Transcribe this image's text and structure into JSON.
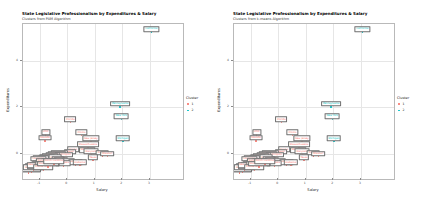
{
  "figure": {
    "background": "#ffffff",
    "panel_border": "#b9b9b9",
    "grid_color": "#f0f0f0"
  },
  "panels": [
    {
      "key": "pam",
      "title": "State Legislative Professionalism by Expenditures & Salary",
      "subtitle": "Clusters from PAM Algorithm",
      "legend_title": "Cluster"
    },
    {
      "key": "kmeans",
      "title": "State Legislative Professionalism by Expenditures & Salary",
      "subtitle": "Clusters from k-means Algorithm",
      "legend_title": "Cluster"
    }
  ],
  "chart_data": [
    {
      "type": "scatter",
      "title": "State Legislative Professionalism by Expenditures & Salary",
      "subtitle": "Clusters from PAM Algorithm",
      "xlabel": "Salary",
      "ylabel": "Expenditures",
      "xlim": [
        -1.6,
        4.2
      ],
      "ylim": [
        -1.1,
        5.6
      ],
      "xticks": [
        -1,
        0,
        1,
        2,
        3
      ],
      "yticks": [
        0,
        2,
        4
      ],
      "grid": true,
      "legend_position": "right",
      "legend_title": "Cluster",
      "legend_entries": [
        {
          "label": "1",
          "color": "#f8766d"
        },
        {
          "label": "2",
          "color": "#00bfc4"
        }
      ],
      "points": [
        {
          "label": "California",
          "x": 3.05,
          "y": 5.25,
          "cluster": "2"
        },
        {
          "label": "Pennsylvania",
          "x": 1.92,
          "y": 2.02,
          "cluster": "2"
        },
        {
          "label": "New York",
          "x": 1.96,
          "y": 1.48,
          "cluster": "2"
        },
        {
          "label": "Michigan",
          "x": 2.02,
          "y": 0.52,
          "cluster": "2"
        },
        {
          "label": "Florida",
          "x": 0.12,
          "y": 1.34,
          "cluster": "1"
        },
        {
          "label": "Illinois",
          "x": 0.52,
          "y": 0.78,
          "cluster": "1"
        },
        {
          "label": "Ohio",
          "x": -0.78,
          "y": 0.8,
          "cluster": "1"
        },
        {
          "label": "Nevada",
          "x": -0.8,
          "y": 0.55,
          "cluster": "1"
        },
        {
          "label": "New Jersey",
          "x": 0.86,
          "y": 0.52,
          "cluster": "1"
        },
        {
          "label": "Massachusetts",
          "x": 0.76,
          "y": 0.26,
          "cluster": "1"
        },
        {
          "label": "Wisconsin",
          "x": 0.72,
          "y": 0.02,
          "cluster": "1"
        },
        {
          "label": "Maryland",
          "x": 0.88,
          "y": -0.04,
          "cluster": "1"
        },
        {
          "label": "Alaska",
          "x": 0.22,
          "y": 0.04,
          "cluster": "1"
        },
        {
          "label": "Hawaii",
          "x": 0.1,
          "y": -0.06,
          "cluster": "1"
        },
        {
          "label": "Arizona",
          "x": 1.28,
          "y": -0.1,
          "cluster": "1"
        },
        {
          "label": "Missouri",
          "x": 1.46,
          "y": -0.14,
          "cluster": "1"
        },
        {
          "label": "Minnesota",
          "x": -0.28,
          "y": -0.1,
          "cluster": "1"
        },
        {
          "label": "Connecticut",
          "x": -0.38,
          "y": -0.14,
          "cluster": "1"
        },
        {
          "label": "Washington",
          "x": -0.12,
          "y": -0.18,
          "cluster": "1"
        },
        {
          "label": "Colorado",
          "x": -0.52,
          "y": -0.2,
          "cluster": "1"
        },
        {
          "label": "Oklahoma",
          "x": -0.62,
          "y": -0.24,
          "cluster": "1"
        },
        {
          "label": "Delaware",
          "x": -0.72,
          "y": -0.28,
          "cluster": "1"
        },
        {
          "label": "Virginia",
          "x": -0.44,
          "y": -0.3,
          "cluster": "1"
        },
        {
          "label": "Iowa",
          "x": -0.86,
          "y": -0.32,
          "cluster": "1"
        },
        {
          "label": "Tennessee",
          "x": -0.96,
          "y": -0.34,
          "cluster": "1"
        },
        {
          "label": "Louisiana",
          "x": -1.04,
          "y": -0.36,
          "cluster": "1"
        },
        {
          "label": "Oregon",
          "x": -0.34,
          "y": -0.38,
          "cluster": "1"
        },
        {
          "label": "Kentucky",
          "x": -0.24,
          "y": -0.42,
          "cluster": "1"
        },
        {
          "label": "Nebraska",
          "x": -0.66,
          "y": -0.44,
          "cluster": "1"
        },
        {
          "label": "Kansas",
          "x": -0.9,
          "y": -0.46,
          "cluster": "1"
        },
        {
          "label": "Indiana",
          "x": 0.04,
          "y": -0.48,
          "cluster": "1"
        },
        {
          "label": "Georgia",
          "x": 0.3,
          "y": -0.5,
          "cluster": "1"
        },
        {
          "label": "Alabama",
          "x": 0.46,
          "y": -0.52,
          "cluster": "1"
        },
        {
          "label": "Arkansas",
          "x": -0.14,
          "y": -0.54,
          "cluster": "1"
        },
        {
          "label": "Mississippi",
          "x": -0.56,
          "y": -0.56,
          "cluster": "1"
        },
        {
          "label": "Idaho",
          "x": -1.1,
          "y": -0.58,
          "cluster": "1"
        },
        {
          "label": "Maine",
          "x": -1.18,
          "y": -0.62,
          "cluster": "1"
        },
        {
          "label": "Vermont",
          "x": -1.26,
          "y": -0.66,
          "cluster": "1"
        },
        {
          "label": "Montana",
          "x": -1.32,
          "y": -0.7,
          "cluster": "1"
        },
        {
          "label": "Wyoming",
          "x": -1.36,
          "y": -0.76,
          "cluster": "1"
        },
        {
          "label": "New Hampshire",
          "x": -1.4,
          "y": -0.84,
          "cluster": "1"
        },
        {
          "label": "North Dakota",
          "x": -1.3,
          "y": -0.8,
          "cluster": "1"
        },
        {
          "label": "South Dakota",
          "x": -1.22,
          "y": -0.74,
          "cluster": "1"
        },
        {
          "label": "West Virginia",
          "x": -1.08,
          "y": -0.68,
          "cluster": "1"
        },
        {
          "label": "New Mexico",
          "x": -1.14,
          "y": -0.64,
          "cluster": "1"
        },
        {
          "label": "Utah",
          "x": -0.98,
          "y": -0.6,
          "cluster": "1"
        },
        {
          "label": "Rhode Island",
          "x": -0.86,
          "y": -0.72,
          "cluster": "1"
        },
        {
          "label": "South Carolina",
          "x": -0.7,
          "y": -0.58,
          "cluster": "1"
        },
        {
          "label": "North Carolina",
          "x": -0.48,
          "y": -0.46,
          "cluster": "1"
        },
        {
          "label": "Texas",
          "x": 0.94,
          "y": -0.3,
          "cluster": "1"
        }
      ]
    },
    {
      "type": "scatter",
      "title": "State Legislative Professionalism by Expenditures & Salary",
      "subtitle": "Clusters from k-means Algorithm",
      "xlabel": "Salary",
      "ylabel": "Expenditures",
      "xlim": [
        -1.6,
        4.2
      ],
      "ylim": [
        -1.1,
        5.6
      ],
      "xticks": [
        -1,
        0,
        1,
        2,
        3
      ],
      "yticks": [
        0,
        2,
        4
      ],
      "grid": true,
      "legend_position": "right",
      "legend_title": "Cluster",
      "legend_entries": [
        {
          "label": "1",
          "color": "#f8766d"
        },
        {
          "label": "2",
          "color": "#00bfc4"
        }
      ],
      "points": [
        {
          "label": "California",
          "x": 3.05,
          "y": 5.25,
          "cluster": "2"
        },
        {
          "label": "Pennsylvania",
          "x": 1.92,
          "y": 2.02,
          "cluster": "2"
        },
        {
          "label": "New York",
          "x": 1.96,
          "y": 1.48,
          "cluster": "2"
        },
        {
          "label": "Michigan",
          "x": 2.02,
          "y": 0.52,
          "cluster": "2"
        },
        {
          "label": "Florida",
          "x": 0.12,
          "y": 1.34,
          "cluster": "1"
        },
        {
          "label": "Illinois",
          "x": 0.52,
          "y": 0.78,
          "cluster": "1"
        },
        {
          "label": "Ohio",
          "x": -0.78,
          "y": 0.8,
          "cluster": "1"
        },
        {
          "label": "Nevada",
          "x": -0.8,
          "y": 0.55,
          "cluster": "1"
        },
        {
          "label": "New Jersey",
          "x": 0.86,
          "y": 0.52,
          "cluster": "1"
        },
        {
          "label": "Massachusetts",
          "x": 0.76,
          "y": 0.26,
          "cluster": "1"
        },
        {
          "label": "Wisconsin",
          "x": 0.72,
          "y": 0.02,
          "cluster": "1"
        },
        {
          "label": "Maryland",
          "x": 0.88,
          "y": -0.04,
          "cluster": "1"
        },
        {
          "label": "Alaska",
          "x": 0.22,
          "y": 0.04,
          "cluster": "1"
        },
        {
          "label": "Hawaii",
          "x": 0.1,
          "y": -0.06,
          "cluster": "1"
        },
        {
          "label": "Arizona",
          "x": 1.28,
          "y": -0.1,
          "cluster": "1"
        },
        {
          "label": "Missouri",
          "x": 1.46,
          "y": -0.14,
          "cluster": "1"
        },
        {
          "label": "Minnesota",
          "x": -0.28,
          "y": -0.1,
          "cluster": "1"
        },
        {
          "label": "Connecticut",
          "x": -0.38,
          "y": -0.14,
          "cluster": "1"
        },
        {
          "label": "Washington",
          "x": -0.12,
          "y": -0.18,
          "cluster": "1"
        },
        {
          "label": "Colorado",
          "x": -0.52,
          "y": -0.2,
          "cluster": "1"
        },
        {
          "label": "Oklahoma",
          "x": -0.62,
          "y": -0.24,
          "cluster": "1"
        },
        {
          "label": "Delaware",
          "x": -0.72,
          "y": -0.28,
          "cluster": "1"
        },
        {
          "label": "Virginia",
          "x": -0.44,
          "y": -0.3,
          "cluster": "1"
        },
        {
          "label": "Iowa",
          "x": -0.86,
          "y": -0.32,
          "cluster": "1"
        },
        {
          "label": "Tennessee",
          "x": -0.96,
          "y": -0.34,
          "cluster": "1"
        },
        {
          "label": "Louisiana",
          "x": -1.04,
          "y": -0.36,
          "cluster": "1"
        },
        {
          "label": "Oregon",
          "x": -0.34,
          "y": -0.38,
          "cluster": "1"
        },
        {
          "label": "Kentucky",
          "x": -0.24,
          "y": -0.42,
          "cluster": "1"
        },
        {
          "label": "Nebraska",
          "x": -0.66,
          "y": -0.44,
          "cluster": "1"
        },
        {
          "label": "Kansas",
          "x": -0.9,
          "y": -0.46,
          "cluster": "1"
        },
        {
          "label": "Indiana",
          "x": 0.04,
          "y": -0.48,
          "cluster": "1"
        },
        {
          "label": "Georgia",
          "x": 0.3,
          "y": -0.5,
          "cluster": "1"
        },
        {
          "label": "Alabama",
          "x": 0.46,
          "y": -0.52,
          "cluster": "1"
        },
        {
          "label": "Arkansas",
          "x": -0.14,
          "y": -0.54,
          "cluster": "1"
        },
        {
          "label": "Mississippi",
          "x": -0.56,
          "y": -0.56,
          "cluster": "1"
        },
        {
          "label": "Idaho",
          "x": -1.1,
          "y": -0.58,
          "cluster": "1"
        },
        {
          "label": "Maine",
          "x": -1.18,
          "y": -0.62,
          "cluster": "1"
        },
        {
          "label": "Vermont",
          "x": -1.26,
          "y": -0.66,
          "cluster": "1"
        },
        {
          "label": "Montana",
          "x": -1.32,
          "y": -0.7,
          "cluster": "1"
        },
        {
          "label": "Wyoming",
          "x": -1.36,
          "y": -0.76,
          "cluster": "1"
        },
        {
          "label": "New Hampshire",
          "x": -1.4,
          "y": -0.84,
          "cluster": "1"
        },
        {
          "label": "North Dakota",
          "x": -1.3,
          "y": -0.8,
          "cluster": "1"
        },
        {
          "label": "South Dakota",
          "x": -1.22,
          "y": -0.74,
          "cluster": "1"
        },
        {
          "label": "West Virginia",
          "x": -1.08,
          "y": -0.68,
          "cluster": "1"
        },
        {
          "label": "New Mexico",
          "x": -1.14,
          "y": -0.64,
          "cluster": "1"
        },
        {
          "label": "Utah",
          "x": -0.98,
          "y": -0.6,
          "cluster": "1"
        },
        {
          "label": "Rhode Island",
          "x": -0.86,
          "y": -0.72,
          "cluster": "1"
        },
        {
          "label": "South Carolina",
          "x": -0.7,
          "y": -0.58,
          "cluster": "1"
        },
        {
          "label": "North Carolina",
          "x": -0.48,
          "y": -0.46,
          "cluster": "1"
        },
        {
          "label": "Texas",
          "x": 0.94,
          "y": -0.3,
          "cluster": "1"
        }
      ]
    }
  ]
}
